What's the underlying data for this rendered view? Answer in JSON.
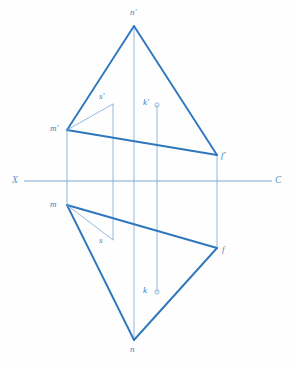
{
  "figure": {
    "type": "descriptive-geometry-diagram",
    "canvas": {
      "width": 291,
      "height": 365
    },
    "colors": {
      "stroke_heavy": "#2f77bd",
      "stroke_light": "#86b2dc",
      "stroke_axis": "#7aa9d6",
      "label": "#3f7fc4",
      "axis_label": "#5a8fc9",
      "background": "#fefefe"
    }
  },
  "axis": {
    "name": "ground-line",
    "left_label": "X",
    "right_label": "C",
    "y": 181,
    "x_start": 24,
    "x_end": 272,
    "left_label_pos": {
      "x": 12,
      "y": 176
    },
    "right_label_pos": {
      "x": 275,
      "y": 176
    }
  },
  "points": [
    {
      "id": "n-prime",
      "label": "n'",
      "x": 134,
      "y": 26,
      "label_x": 130,
      "label_y": 8,
      "marker": "none"
    },
    {
      "id": "m-prime",
      "label": "m'",
      "x": 67,
      "y": 130,
      "label_x": 50,
      "label_y": 124,
      "marker": "none"
    },
    {
      "id": "f-prime",
      "label": "f'",
      "x": 217,
      "y": 155,
      "label_x": 221,
      "label_y": 151,
      "marker": "none"
    },
    {
      "id": "s-prime",
      "label": "s'",
      "x": 113,
      "y": 104,
      "label_x": 99,
      "label_y": 92,
      "marker": "none"
    },
    {
      "id": "k-prime",
      "label": "k'",
      "x": 157,
      "y": 105,
      "label_x": 143,
      "label_y": 98,
      "marker": "circle"
    },
    {
      "id": "m",
      "label": "m",
      "x": 67,
      "y": 205,
      "label_x": 50,
      "label_y": 200,
      "marker": "none"
    },
    {
      "id": "s",
      "label": "s",
      "x": 113,
      "y": 240,
      "label_x": 99,
      "label_y": 236,
      "marker": "none"
    },
    {
      "id": "f",
      "label": "f",
      "x": 217,
      "y": 248,
      "label_x": 222,
      "label_y": 245,
      "marker": "none"
    },
    {
      "id": "k",
      "label": "k",
      "x": 157,
      "y": 292,
      "label_x": 143,
      "label_y": 286,
      "marker": "circle"
    },
    {
      "id": "n",
      "label": "n",
      "x": 134,
      "y": 340,
      "label_x": 130,
      "label_y": 345,
      "marker": "none"
    }
  ],
  "edges": [
    {
      "id": "edge-nprime-mprime",
      "from": [
        134,
        26
      ],
      "to": [
        67,
        130
      ],
      "weight": "heavy"
    },
    {
      "id": "edge-nprime-fprime",
      "from": [
        134,
        26
      ],
      "to": [
        217,
        155
      ],
      "weight": "heavy"
    },
    {
      "id": "edge-mprime-fprime",
      "from": [
        67,
        130
      ],
      "to": [
        217,
        155
      ],
      "weight": "heavy"
    },
    {
      "id": "edge-m-n",
      "from": [
        67,
        205
      ],
      "to": [
        134,
        340
      ],
      "weight": "heavy"
    },
    {
      "id": "edge-n-f",
      "from": [
        134,
        340
      ],
      "to": [
        217,
        248
      ],
      "weight": "heavy"
    },
    {
      "id": "edge-m-f",
      "from": [
        67,
        205
      ],
      "to": [
        217,
        248
      ],
      "weight": "heavy"
    },
    {
      "id": "edge-mprime-sprime",
      "from": [
        67,
        130
      ],
      "to": [
        113,
        104
      ],
      "weight": "light"
    },
    {
      "id": "edge-m-s",
      "from": [
        67,
        205
      ],
      "to": [
        113,
        240
      ],
      "weight": "light"
    }
  ],
  "projectors": [
    {
      "id": "projector-n",
      "x": 134,
      "y1": 26,
      "y2": 340,
      "weight": "light"
    },
    {
      "id": "projector-m",
      "x": 67,
      "y1": 130,
      "y2": 205,
      "weight": "light"
    },
    {
      "id": "projector-f",
      "x": 217,
      "y1": 155,
      "y2": 248,
      "weight": "light"
    },
    {
      "id": "projector-s",
      "x": 113,
      "y1": 104,
      "y2": 240,
      "weight": "light"
    },
    {
      "id": "projector-k",
      "x": 157,
      "y1": 105,
      "y2": 292,
      "weight": "light"
    }
  ]
}
